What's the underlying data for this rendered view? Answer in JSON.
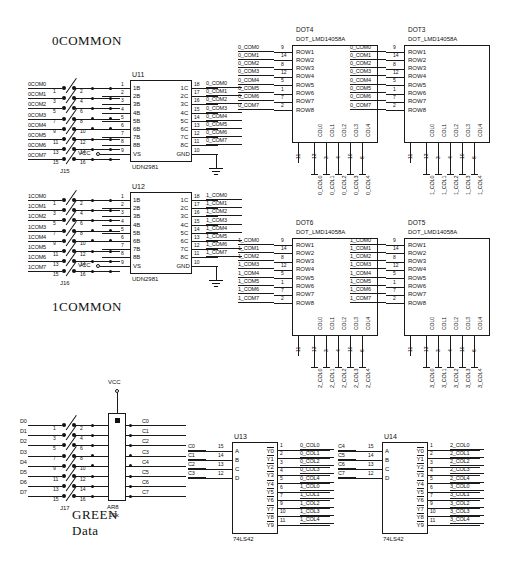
{
  "sheet": {
    "titles": {
      "zero_common": "0COMMON",
      "one_common": "1COMMON",
      "green": "GREEN",
      "data": "Data"
    },
    "power": {
      "vcc": "VCC"
    }
  },
  "common0_block": {
    "connector": {
      "ref": "J15",
      "pins_left": [
        "1",
        "3",
        "5",
        "7",
        "9",
        "11",
        "13",
        "15"
      ],
      "pins_right": [
        "2",
        "4",
        "6",
        "8",
        "10",
        "12",
        "14",
        "16"
      ]
    },
    "input_nets": [
      "0COM0",
      "0COM1",
      "0COM2",
      "0COM3",
      "0COM4",
      "0COM5",
      "0COM6",
      "0COM7"
    ],
    "ic": {
      "ref": "U11",
      "part": "UDN2981",
      "left_pins": [
        "1",
        "2",
        "3",
        "4",
        "5",
        "6",
        "7",
        "8",
        "9"
      ],
      "left_names": [
        "1B",
        "2B",
        "3B",
        "4B",
        "5B",
        "6B",
        "7B",
        "8B",
        "VS"
      ],
      "right_pins": [
        "18",
        "17",
        "16",
        "15",
        "14",
        "13",
        "12",
        "11",
        "10"
      ],
      "right_names": [
        "1C",
        "2C",
        "3C",
        "4C",
        "5C",
        "6C",
        "7C",
        "8C",
        "GND"
      ],
      "vcc_label": "VCC"
    },
    "output_nets": [
      "0_COM0",
      "0_COM1",
      "0_COM2",
      "0_COM3",
      "0_COM4",
      "0_COM5",
      "0_COM6",
      "0_COM7"
    ]
  },
  "common1_block": {
    "connector": {
      "ref": "J16",
      "pins_left": [
        "1",
        "3",
        "5",
        "7",
        "9",
        "11",
        "13",
        "15"
      ],
      "pins_right": [
        "2",
        "4",
        "6",
        "8",
        "10",
        "12",
        "14",
        "16"
      ]
    },
    "input_nets": [
      "1COM0",
      "1COM1",
      "1COM2",
      "1COM3",
      "1COM4",
      "1COM5",
      "1COM6",
      "1COM7"
    ],
    "ic": {
      "ref": "U12",
      "part": "UDN2981",
      "left_pins": [
        "1",
        "2",
        "3",
        "4",
        "5",
        "6",
        "7",
        "8",
        "9"
      ],
      "left_names": [
        "1B",
        "2B",
        "3B",
        "4B",
        "5B",
        "6B",
        "7B",
        "8B",
        "VS"
      ],
      "right_pins": [
        "18",
        "17",
        "16",
        "15",
        "14",
        "13",
        "12",
        "11",
        "10"
      ],
      "right_names": [
        "1C",
        "2C",
        "3C",
        "4C",
        "5C",
        "6C",
        "7C",
        "8C",
        "GND"
      ],
      "vcc_label": "VCC"
    },
    "output_nets": [
      "1_COM0",
      "1_COM1",
      "1_COM2",
      "1_COM3",
      "1_COM4",
      "1_COM5",
      "1_COM6",
      "1_COM7"
    ]
  },
  "dot_matrix_common": {
    "part": "DOT_LMD14058A",
    "row_names": [
      "ROW1",
      "ROW2",
      "ROW3",
      "ROW4",
      "ROW5",
      "ROW6",
      "ROW7",
      "ROW8"
    ],
    "row_pins": [
      "9",
      "14",
      "8",
      "12",
      "5",
      "1",
      "7",
      "2"
    ],
    "col_names": [
      "COL0",
      "COL1",
      "COL2",
      "COL3",
      "COL4"
    ],
    "col_pins": [
      "13",
      "3",
      "4",
      "10",
      "6"
    ],
    "extra_pin": "11"
  },
  "dot_modules": [
    {
      "ref": "DOT4",
      "com_prefix": "0_COM",
      "col_prefix": "0_COL"
    },
    {
      "ref": "DOT3",
      "com_prefix": "0_COM",
      "col_prefix": "1_COL"
    },
    {
      "ref": "DOT6",
      "com_prefix": "1_COM",
      "col_prefix": "2_COL"
    },
    {
      "ref": "DOT5",
      "com_prefix": "1_COM",
      "col_prefix": "3_COL"
    }
  ],
  "data_block": {
    "connector": {
      "ref": "J17",
      "pins_left": [
        "1",
        "3",
        "5",
        "7",
        "9",
        "11",
        "13",
        "15"
      ],
      "pins_right": [
        "2",
        "4",
        "6",
        "8",
        "10",
        "12",
        "14",
        "16"
      ]
    },
    "input_nets": [
      "D0",
      "D1",
      "D2",
      "D3",
      "D4",
      "D5",
      "D6",
      "D7"
    ],
    "resistor_pack": {
      "ref": "AR8",
      "value": "10k"
    },
    "output_nets": [
      "C0",
      "C1",
      "C2",
      "C3",
      "C4",
      "C5",
      "C6",
      "C7"
    ]
  },
  "decoders": [
    {
      "ref": "U13",
      "part": "74LS42",
      "input_nets": [
        "C0",
        "C1",
        "C2",
        "C3"
      ],
      "input_pins": [
        "15",
        "14",
        "13",
        "12"
      ],
      "input_names": [
        "A",
        "B",
        "C",
        "D"
      ],
      "output_names": [
        "Y0",
        "Y1",
        "Y2",
        "Y3",
        "Y4",
        "Y5",
        "Y6",
        "Y7",
        "Y8",
        "Y9"
      ],
      "output_pins": [
        "1",
        "2",
        "3",
        "4",
        "5",
        "6",
        "7",
        "9",
        "10",
        "11"
      ],
      "output_nets": [
        "0_COL0",
        "0_COL1",
        "0_COL2",
        "0_COL3",
        "0_COL4",
        "1_COL0",
        "1_COL1",
        "1_COL2",
        "1_COL3",
        "1_COL4"
      ]
    },
    {
      "ref": "U14",
      "part": "74LS42",
      "input_nets": [
        "C4",
        "C5",
        "C6",
        "C7"
      ],
      "input_pins": [
        "15",
        "14",
        "13",
        "12"
      ],
      "input_names": [
        "A",
        "B",
        "C",
        "D"
      ],
      "output_names": [
        "Y0",
        "Y1",
        "Y2",
        "Y3",
        "Y4",
        "Y5",
        "Y6",
        "Y7",
        "Y8",
        "Y9"
      ],
      "output_pins": [
        "1",
        "2",
        "3",
        "4",
        "5",
        "6",
        "7",
        "9",
        "10",
        "11"
      ],
      "output_nets": [
        "2_COL0",
        "2_COL1",
        "2_COL2",
        "2_COL3",
        "2_COL4",
        "3_COL0",
        "3_COL1",
        "3_COL2",
        "3_COL3",
        "3_COL4"
      ]
    }
  ]
}
